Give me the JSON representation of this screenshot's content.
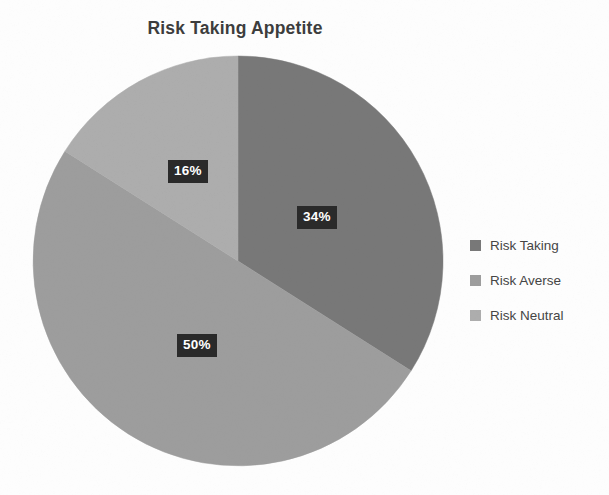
{
  "chart": {
    "title": "Risk Taking Appetite"
  },
  "legend": {
    "items": [
      {
        "label": "Risk Taking",
        "color": "#787878"
      },
      {
        "label": "Risk Averse",
        "color": "#9d9d9d"
      },
      {
        "label": "Risk Neutral",
        "color": "#adadad"
      }
    ]
  },
  "labels": [
    {
      "text": "34%",
      "left": 297,
      "top": 206
    },
    {
      "text": "16%",
      "left": 168,
      "top": 160
    },
    {
      "text": "50%",
      "left": 177,
      "top": 334
    }
  ],
  "geometry": {
    "cx": 238,
    "cy": 261,
    "r": 205,
    "start_angle_deg": 0
  },
  "chart_data": {
    "type": "pie",
    "title": "Risk Taking Appetite",
    "categories": [
      "Risk Taking",
      "Risk Averse",
      "Risk Neutral"
    ],
    "values": [
      34,
      50,
      16
    ],
    "value_unit": "%",
    "data_labels": [
      "34%",
      "16%",
      "50%"
    ],
    "colors": [
      "#787878",
      "#9d9d9d",
      "#adadad"
    ],
    "legend_position": "right",
    "start_angle_deg": 0,
    "direction": "clockwise",
    "grid": false,
    "xlabel": "",
    "ylabel": ""
  }
}
